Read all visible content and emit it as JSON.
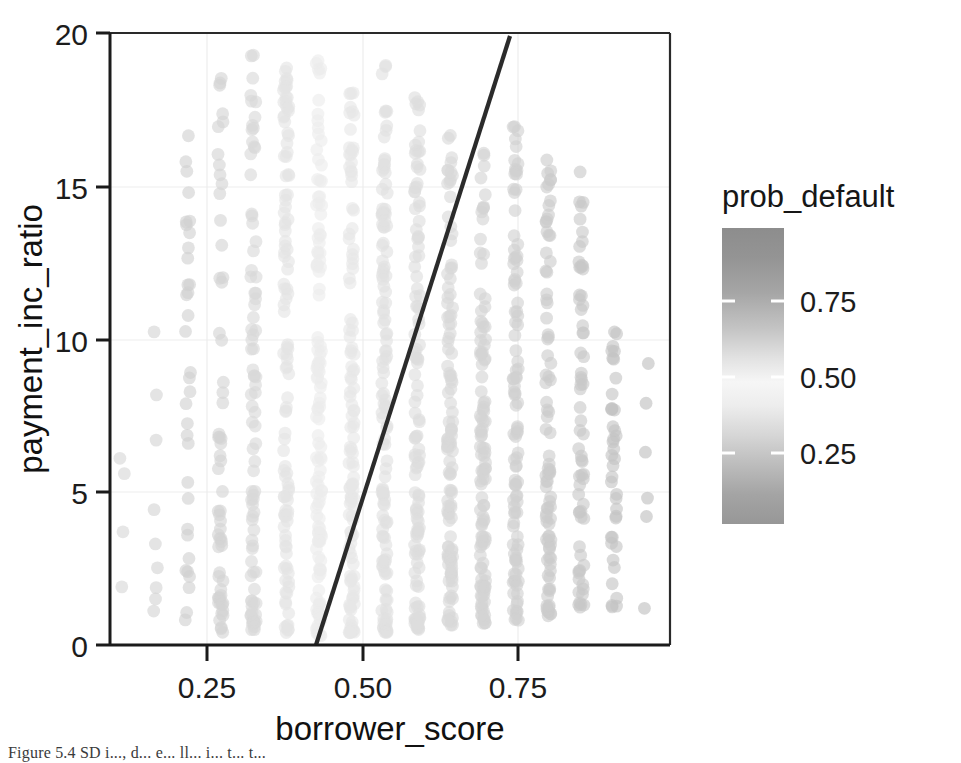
{
  "figure": {
    "caption": "Figure 5.4 SD i..., d... e... ll... i... t... t..."
  },
  "axes": {
    "x_title": "borrower_score",
    "y_title": "payment_inc_ratio",
    "x_ticks": [
      "0.25",
      "0.50",
      "0.75"
    ],
    "y_ticks": [
      "20",
      "15",
      "10",
      "5",
      "0"
    ]
  },
  "legend": {
    "title": "prob_default",
    "ticks": [
      "0.75",
      "0.50",
      "0.25"
    ]
  },
  "colors": {
    "axis_line": "#1b1b1b",
    "boundary_line": "#2b2b2b",
    "background": "#ffffff",
    "grid": "#ededed",
    "point_dark": "#8c8c8c",
    "point_light": "#e3e3e3",
    "colorbar_dark": "#8f8f8f",
    "colorbar_light": "#f4f4f4"
  },
  "chart_data": {
    "type": "scatter",
    "title": "",
    "xlabel": "borrower_score",
    "ylabel": "payment_inc_ratio",
    "xlim": [
      0.1,
      0.92
    ],
    "ylim": [
      0,
      20
    ],
    "xticks": [
      0.25,
      0.5,
      0.75
    ],
    "yticks": [
      0,
      5,
      10,
      15,
      20
    ],
    "grid": true,
    "legend": {
      "position": "right",
      "title": "prob_default",
      "ticks": [
        0.25,
        0.5,
        0.75
      ],
      "range": [
        0,
        1
      ],
      "type": "continuous-colorbar"
    },
    "annotations": [
      {
        "type": "line",
        "name": "decision-boundary",
        "x": [
          0.385,
          0.731
        ],
        "y": [
          0,
          20
        ],
        "color": "#2b2b2b",
        "width": 4
      }
    ],
    "series": [
      {
        "name": "loans",
        "encoding": "x = borrower_score (binned), y = payment_inc_ratio, color = prob_default",
        "columns": [
          {
            "x": 0.118,
            "prob_default": 0.6,
            "n": 4,
            "y_values": [
              6.1,
              5.6,
              3.7,
              1.9
            ]
          },
          {
            "x": 0.166,
            "prob_default": 0.62,
            "n": 9,
            "y_range": [
              1.0,
              11.2
            ]
          },
          {
            "x": 0.214,
            "prob_default": 0.64,
            "n": 34,
            "y_range": [
              0.6,
              17.1
            ]
          },
          {
            "x": 0.262,
            "prob_default": 0.62,
            "n": 60,
            "y_range": [
              0.4,
              19.1
            ]
          },
          {
            "x": 0.31,
            "prob_default": 0.58,
            "n": 86,
            "y_range": [
              0.5,
              19.4
            ]
          },
          {
            "x": 0.358,
            "prob_default": 0.5,
            "n": 110,
            "y_range": [
              0.4,
              19.3
            ]
          },
          {
            "x": 0.406,
            "prob_default": 0.45,
            "n": 124,
            "y_range": [
              0.3,
              19.6
            ]
          },
          {
            "x": 0.454,
            "prob_default": 0.4,
            "n": 118,
            "y_range": [
              0.4,
              18.4
            ]
          },
          {
            "x": 0.502,
            "prob_default": 0.36,
            "n": 126,
            "y_range": [
              0.4,
              19.5
            ]
          },
          {
            "x": 0.55,
            "prob_default": 0.33,
            "n": 120,
            "y_range": [
              0.5,
              18.0
            ]
          },
          {
            "x": 0.598,
            "prob_default": 0.3,
            "n": 116,
            "y_range": [
              0.6,
              16.9
            ]
          },
          {
            "x": 0.646,
            "prob_default": 0.27,
            "n": 112,
            "y_range": [
              0.7,
              16.4
            ]
          },
          {
            "x": 0.694,
            "prob_default": 0.24,
            "n": 104,
            "y_range": [
              0.8,
              17.5
            ]
          },
          {
            "x": 0.742,
            "prob_default": 0.21,
            "n": 88,
            "y_range": [
              0.9,
              16.2
            ]
          },
          {
            "x": 0.79,
            "prob_default": 0.18,
            "n": 66,
            "y_range": [
              1.1,
              15.7
            ]
          },
          {
            "x": 0.838,
            "prob_default": 0.15,
            "n": 40,
            "y_range": [
              1.2,
              11.2
            ]
          },
          {
            "x": 0.886,
            "prob_default": 0.12,
            "n": 14,
            "y_values": [
              9.2,
              7.9,
              6.3,
              4.8,
              4.2,
              1.2
            ]
          }
        ]
      }
    ]
  }
}
